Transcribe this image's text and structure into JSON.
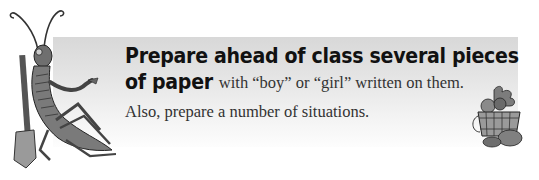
{
  "instruction": {
    "handwritten_line1": "Prepare ahead of class several pieces",
    "handwritten_line2": "of paper",
    "serif_line2": "with “boy” or “girl” written on them.",
    "serif_line3": "Also, prepare a number of situations."
  },
  "illustrations": {
    "left": "grasshopper-with-shovel",
    "right": "vegetable-basket"
  }
}
